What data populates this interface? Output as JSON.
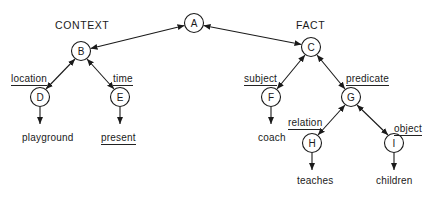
{
  "diagram": {
    "type": "semantic-network",
    "headers": {
      "context": "CONTEXT",
      "fact": "FACT"
    },
    "nodes": [
      {
        "id": "A",
        "label": "A",
        "x": 194,
        "y": 23
      },
      {
        "id": "B",
        "label": "B",
        "x": 81,
        "y": 51
      },
      {
        "id": "C",
        "label": "C",
        "x": 311,
        "y": 47
      },
      {
        "id": "D",
        "label": "D",
        "x": 40,
        "y": 97
      },
      {
        "id": "E",
        "label": "E",
        "x": 120,
        "y": 97
      },
      {
        "id": "F",
        "label": "F",
        "x": 271,
        "y": 97
      },
      {
        "id": "G",
        "label": "G",
        "x": 351,
        "y": 97
      },
      {
        "id": "H",
        "label": "H",
        "x": 312,
        "y": 143
      },
      {
        "id": "I",
        "label": "I",
        "x": 394,
        "y": 143
      }
    ],
    "edge_labels": {
      "location": "location",
      "time": "time",
      "subject": "subject",
      "predicate": "predicate",
      "relation": "relation",
      "object": "object"
    },
    "edges": [
      {
        "from": "A",
        "to": "B",
        "type": "bidirectional"
      },
      {
        "from": "A",
        "to": "C",
        "type": "bidirectional"
      },
      {
        "from": "B",
        "to": "D",
        "type": "bidirectional",
        "label": "location"
      },
      {
        "from": "B",
        "to": "E",
        "type": "bidirectional",
        "label": "time"
      },
      {
        "from": "C",
        "to": "F",
        "type": "bidirectional",
        "label": "subject"
      },
      {
        "from": "C",
        "to": "G",
        "type": "bidirectional",
        "label": "predicate"
      },
      {
        "from": "G",
        "to": "H",
        "type": "bidirectional",
        "label": "relation"
      },
      {
        "from": "G",
        "to": "I",
        "type": "bidirectional",
        "label": "object"
      },
      {
        "from": "D",
        "to": "playground",
        "type": "directed"
      },
      {
        "from": "E",
        "to": "present",
        "type": "directed"
      },
      {
        "from": "F",
        "to": "coach",
        "type": "directed"
      },
      {
        "from": "H",
        "to": "teaches",
        "type": "directed"
      },
      {
        "from": "I",
        "to": "children",
        "type": "directed"
      }
    ],
    "values": {
      "playground": "playground",
      "present": "present",
      "coach": "coach",
      "teaches": "teaches",
      "children": "children"
    }
  }
}
